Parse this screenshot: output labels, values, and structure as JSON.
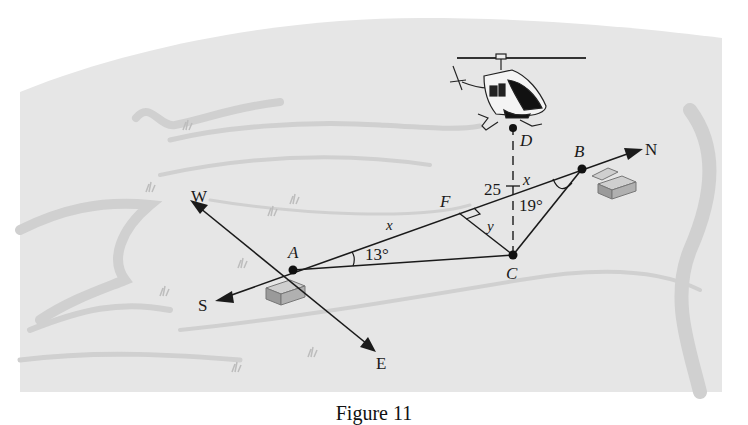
{
  "figure": {
    "caption": "Figure 11",
    "colors": {
      "terrain": "#e6e6e6",
      "terrain_shade": "#d2d2d2",
      "line": "#1a1a1a",
      "building_top": "#c4c4c4",
      "building_side": "#9a9a9a"
    }
  },
  "points": {
    "A": "A",
    "B": "B",
    "C": "C",
    "D": "D",
    "F": "F"
  },
  "directions": {
    "north": "N",
    "south": "S",
    "east": "E",
    "west": "W"
  },
  "measures": {
    "angle_A": "13°",
    "angle_B": "19°",
    "segment_AF": "x",
    "segment_FB": "25 – x",
    "segment_FB_num": "25",
    "segment_FB_var": "x",
    "segment_FC": "y"
  },
  "objects": {
    "helicopter": "helicopter",
    "building_A": "building",
    "building_B": "building"
  }
}
